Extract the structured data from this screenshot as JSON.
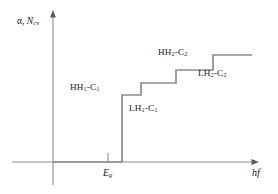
{
  "figure": {
    "kind": "absorption-staircase-plot",
    "line_color": "#8c8c8c",
    "axis_color": "#6e6e6e",
    "text_color": "#1a1a1a",
    "background": "#ffffff"
  },
  "axes": {
    "y_label_prefix": "α, ",
    "y_label_symbol": "N",
    "y_label_subscript": "cv",
    "x_label": "hf",
    "threshold_tick_symbol": "E",
    "threshold_tick_subscript": "g"
  },
  "labels": {
    "hh1c1": {
      "main": "HH",
      "sub1": "1",
      "mid": "-C",
      "sub2": "1"
    },
    "lh1c1": {
      "main": "LH",
      "sub1": "1",
      "mid": "-C",
      "sub2": "1"
    },
    "hh2c2": {
      "main": "HH",
      "sub1": "2",
      "mid": "-C",
      "sub2": "2"
    },
    "lh2c2": {
      "main": "LH",
      "sub1": "2",
      "mid": "-C",
      "sub2": "2"
    }
  },
  "chart_data": {
    "type": "line",
    "title": "",
    "xlabel": "hf",
    "ylabel": "α, Ncv",
    "grid": false,
    "legend": null,
    "xlim": [
      0,
      1
    ],
    "ylim": [
      0,
      1
    ],
    "x_ticks": [
      {
        "label": "Eg",
        "x_px": 108
      }
    ],
    "series": [
      {
        "name": "absorption-staircase",
        "points_px": [
          {
            "x": 53,
            "y": 162
          },
          {
            "x": 122,
            "y": 162
          },
          {
            "x": 122,
            "y": 95
          },
          {
            "x": 141,
            "y": 95
          },
          {
            "x": 141,
            "y": 83
          },
          {
            "x": 176,
            "y": 83
          },
          {
            "x": 176,
            "y": 70
          },
          {
            "x": 213,
            "y": 70
          },
          {
            "x": 213,
            "y": 55
          },
          {
            "x": 252,
            "y": 55
          }
        ],
        "step_transitions": [
          {
            "label": "HH1-C1",
            "level": 1
          },
          {
            "label": "LH1-C1",
            "level": 2
          },
          {
            "label": "HH2-C2",
            "level": 3
          },
          {
            "label": "LH2-C2",
            "level": 4
          }
        ]
      }
    ]
  },
  "geometry": {
    "y_axis_x": 53,
    "y_axis_top": 11,
    "y_axis_bottom": 185,
    "x_axis_y": 162,
    "x_axis_left": 12,
    "x_axis_right": 258,
    "eg_tick_x": 108
  }
}
